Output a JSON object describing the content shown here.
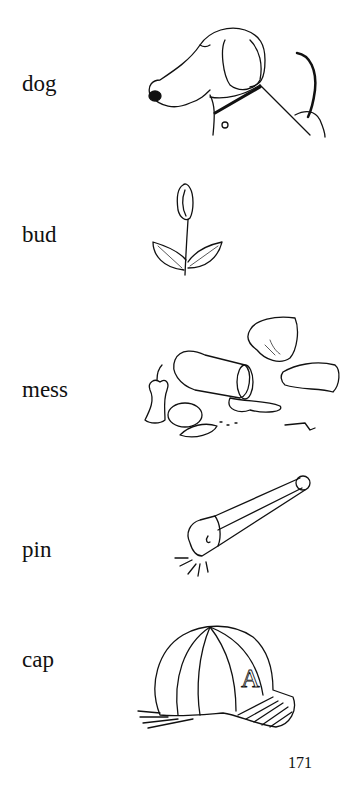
{
  "page": {
    "entries": [
      {
        "word": "dog",
        "picture": "dog-illustration"
      },
      {
        "word": "bud",
        "picture": "rose-bud-illustration"
      },
      {
        "word": "mess",
        "picture": "mess-illustration"
      },
      {
        "word": "pin",
        "picture": "safety-pin-illustration"
      },
      {
        "word": "cap",
        "picture": "baseball-cap-illustration"
      }
    ],
    "page_number": "171",
    "cap_letter": "A"
  }
}
